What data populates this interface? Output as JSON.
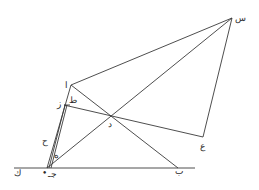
{
  "diagram": {
    "type": "geometric-construction",
    "points": {
      "sin": {
        "label": "س",
        "x": 232,
        "y": 18
      },
      "alif": {
        "label": "ا",
        "x": 71,
        "y": 85
      },
      "zay": {
        "label": "ز",
        "x": 66,
        "y": 105
      },
      "ta": {
        "label": "ط",
        "x": 70,
        "y": 103
      },
      "dal": {
        "label": "د",
        "x": 111,
        "y": 117
      },
      "ayn": {
        "label": "ع",
        "x": 203,
        "y": 137
      },
      "ba": {
        "label": "ب",
        "x": 178,
        "y": 168
      },
      "jim": {
        "label": "جـ",
        "x": 47,
        "y": 168
      },
      "kaf": {
        "label": "ك",
        "x": 17,
        "y": 172
      },
      "ha": {
        "label": "ح",
        "x": 46,
        "y": 140
      },
      "he": {
        "label": "ه",
        "x": 55,
        "y": 155
      }
    },
    "labels": {
      "sin": "س",
      "alif": "ا",
      "zay": "ز",
      "ta": "ط",
      "dal": "د",
      "ayn": "ع",
      "ba": "ب",
      "jim": "جـ",
      "kaf": "ك",
      "ha": "ح",
      "he": "ه",
      "dot": "•"
    }
  }
}
